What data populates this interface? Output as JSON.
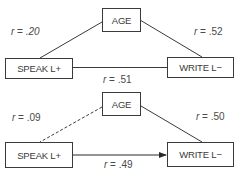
{
  "diagrams": [
    {
      "nodes": {
        "age": "AGE",
        "speak": "SPEAK L+",
        "write": "WRITE L−"
      },
      "edges": {
        "age_speak": {
          "r_symbol": "r",
          "eq": " = ",
          "value": ".20",
          "style": "solid"
        },
        "age_write": {
          "r_symbol": "r",
          "eq": " = ",
          "value": ".52",
          "style": "solid"
        },
        "speak_write": {
          "r_symbol": "r",
          "eq": " = ",
          "value": ".51",
          "style": "solid"
        }
      }
    },
    {
      "nodes": {
        "age": "AGE",
        "speak": "SPEAK L+",
        "write": "WRITE L−"
      },
      "edges": {
        "age_speak": {
          "r_symbol": "r",
          "eq": " = ",
          "value": ".09",
          "style": "dashed"
        },
        "age_write": {
          "r_symbol": "r",
          "eq": " = ",
          "value": ".50",
          "style": "solid"
        },
        "speak_write": {
          "r_symbol": "r",
          "eq": " = ",
          "value": ".49",
          "style": "arrow"
        }
      }
    }
  ],
  "colors": {
    "ink": "#3a3a3a",
    "background": "#ffffff"
  }
}
